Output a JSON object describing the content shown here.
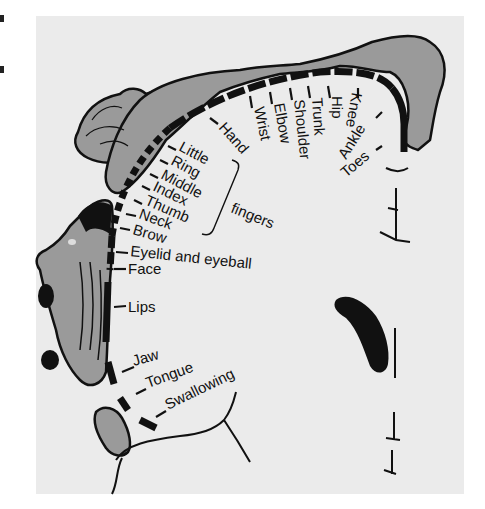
{
  "diagram": {
    "type": "sensory-homunculus",
    "colors": {
      "background": "#ffffff",
      "panel": "#ebebeb",
      "body_fill": "#9a9a9a",
      "ink": "#111111"
    },
    "labels": {
      "hand": "Hand",
      "wrist": "Wrist",
      "elbow": "Elbow",
      "shoulder": "Shoulder",
      "trunk": "Trunk",
      "hip": "Hip",
      "knee": "Knee",
      "ankle": "Ankle",
      "toes": "Toes",
      "little": "Little",
      "ring": "Ring",
      "middle": "Middle",
      "index": "Index",
      "thumb": "Thumb",
      "neck": "Neck",
      "brow": "Brow",
      "eyelid": "Eyelid and eyeball",
      "face": "Face",
      "lips": "Lips",
      "jaw": "Jaw",
      "tongue": "Tongue",
      "swallowing": "Swallowing",
      "fingers": "fingers"
    }
  }
}
